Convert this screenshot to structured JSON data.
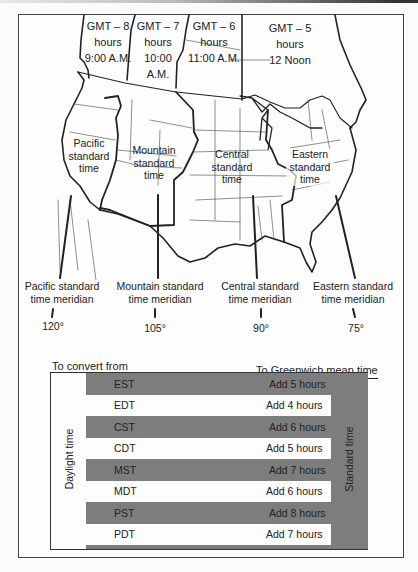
{
  "zones": [
    {
      "offset": "GMT – 8",
      "unit": "hours",
      "time": "9:00 A.M.",
      "name": "Pacific standard time",
      "meridian_label": "Pacific standard time meridian",
      "meridian": "120°"
    },
    {
      "offset": "GMT – 7",
      "unit": "hours",
      "time": "10:00 A.M.",
      "name": "Mountain standard time",
      "meridian_label": "Mountain standard time meridian",
      "meridian": "105°"
    },
    {
      "offset": "GMT – 6",
      "unit": "hours",
      "time": "11:00 A.M.",
      "name": "Central standard time",
      "meridian_label": "Central standard time meridian",
      "meridian": "90°"
    },
    {
      "offset": "GMT – 5",
      "unit": "hours",
      "time": "12 Noon",
      "name": "Eastern standard time",
      "meridian_label": "Eastern standard time meridian",
      "meridian": "75°"
    }
  ],
  "zone_labels": {
    "pacific": [
      "Pacific",
      "standard",
      "time"
    ],
    "mountain": [
      "Mountain",
      "standard",
      "time"
    ],
    "central": [
      "Central",
      "standard",
      "time"
    ],
    "eastern": [
      "Eastern",
      "standard",
      "time"
    ]
  },
  "meridians": {
    "pacific": [
      "Pacific standard",
      "time meridian"
    ],
    "mountain": [
      "Mountain standard",
      "time meridian"
    ],
    "central": [
      "Central standard",
      "time meridian"
    ],
    "eastern": [
      "Eastern standard",
      "time meridian"
    ]
  },
  "table": {
    "header_from": "To convert from",
    "header_to": "To Greenwich mean time",
    "left_label": "Daylight time",
    "right_label": "Standard time",
    "rows": [
      {
        "code": "EST",
        "convert": "Add 5 hours",
        "type": "standard"
      },
      {
        "code": "EDT",
        "convert": "Add 4 hours",
        "type": "daylight"
      },
      {
        "code": "CST",
        "convert": "Add 6 hours",
        "type": "standard"
      },
      {
        "code": "CDT",
        "convert": "Add 5 hours",
        "type": "daylight"
      },
      {
        "code": "MST",
        "convert": "Add 7 hours",
        "type": "standard"
      },
      {
        "code": "MDT",
        "convert": "Add 6 hours",
        "type": "daylight"
      },
      {
        "code": "PST",
        "convert": "Add 8 hours",
        "type": "standard"
      },
      {
        "code": "PDT",
        "convert": "Add 7 hours",
        "type": "daylight"
      }
    ]
  },
  "colors": {
    "standard_band": "#7d7d7d",
    "daylight_row": "#fdfdfd",
    "line": "#222222"
  }
}
